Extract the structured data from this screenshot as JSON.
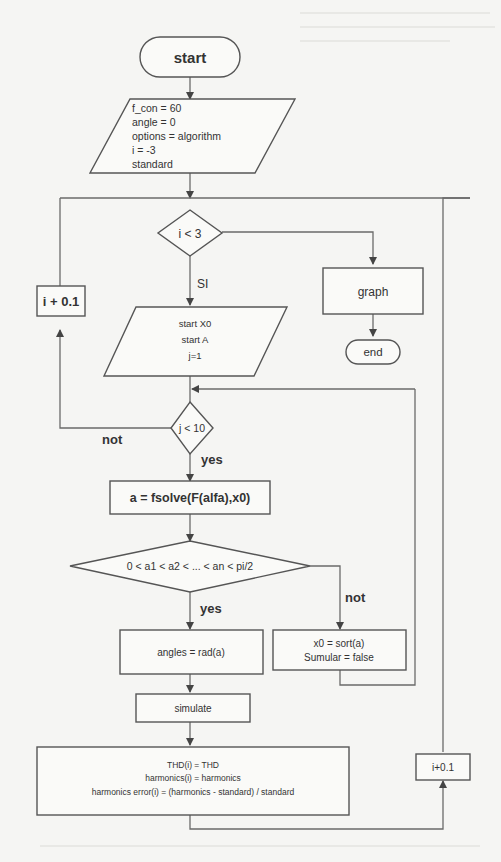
{
  "diagram": {
    "type": "flowchart",
    "nodes": {
      "start": {
        "label": "start"
      },
      "init": {
        "lines": [
          "f_con = 60",
          "angle = 0",
          "options = algorithm",
          "i = -3",
          "standard"
        ]
      },
      "cond_i": {
        "label": "i < 3"
      },
      "graph": {
        "label": "graph"
      },
      "end": {
        "label": "end"
      },
      "inc_i_left": {
        "label": "i + 0.1"
      },
      "start_x0": {
        "lines": [
          "start X0",
          "start A",
          "j=1"
        ]
      },
      "cond_j": {
        "label": "j < 10"
      },
      "fsolve": {
        "label": "a = fsolve(F(alfa),x0)"
      },
      "cond_order": {
        "label": "0 < a1 < a2 < ... < an < pi/2"
      },
      "angles": {
        "label": "angles = rad(a)"
      },
      "sort": {
        "lines": [
          "x0 = sort(a)",
          "Sumular = false"
        ]
      },
      "simulate": {
        "label": "simulate"
      },
      "results": {
        "lines": [
          "THD(i) = THD",
          "harmonics(i) = harmonics",
          "harmonics error(i) = (harmonics - standard) / standard"
        ]
      },
      "inc_i_right": {
        "label": "i+0.1"
      }
    },
    "edge_labels": {
      "si": "SI",
      "not_j": "not",
      "yes_j": "yes",
      "yes_order": "yes",
      "not_order": "not"
    }
  }
}
